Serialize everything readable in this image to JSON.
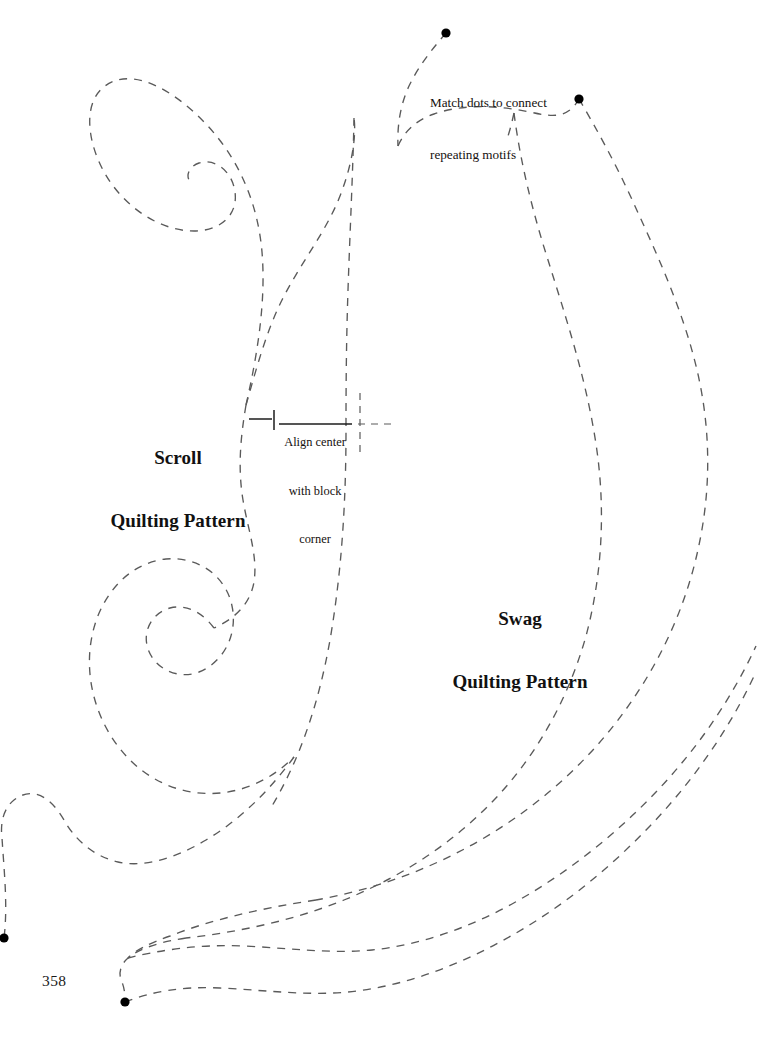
{
  "page": {
    "number": "358",
    "background_color": "#ffffff",
    "ink_color": "#5a5a5a",
    "dot_color": "#000000",
    "width": 760,
    "height": 1040
  },
  "labels": {
    "scroll_title": {
      "line1": "Scroll",
      "line2": "Quilting Pattern"
    },
    "swag_title": {
      "line1": "Swag",
      "line2": "Quilting Pattern"
    },
    "match_note": {
      "line1": "Match dots to connect",
      "line2": "repeating motifs"
    },
    "align_note": {
      "line1": "Align center",
      "line2": "with block",
      "line3": "corner"
    }
  },
  "chart_data": {
    "type": "line",
    "xlabel": "",
    "ylabel": "",
    "xlim": [
      0,
      760
    ],
    "ylim": [
      0,
      1040
    ],
    "grid": false,
    "legend": "none",
    "annotations": [
      {
        "name": "scroll-title",
        "text": "Scroll Quilting Pattern",
        "x": 178,
        "y": 420
      },
      {
        "name": "swag-title",
        "text": "Swag Quilting Pattern",
        "x": 520,
        "y": 583
      },
      {
        "name": "match-note",
        "text": "Match dots to connect repeating motifs",
        "x": 494,
        "y": 77
      },
      {
        "name": "align-note",
        "text": "Align center with block corner",
        "x": 315,
        "y": 424
      },
      {
        "name": "page-number",
        "text": "358",
        "x": 55,
        "y": 984
      }
    ],
    "registration_dots": [
      {
        "name": "top-match-dot",
        "x": 446,
        "y": 33,
        "r": 4.6
      },
      {
        "name": "upper-right-match-dot",
        "x": 579,
        "y": 99,
        "r": 4.6
      },
      {
        "name": "left-edge-match-dot",
        "x": 4,
        "y": 938,
        "r": 4.6
      },
      {
        "name": "bottom-match-dot",
        "x": 125,
        "y": 1002,
        "r": 4.6
      }
    ],
    "registration_marks": [
      {
        "name": "center-tick-dash-left",
        "type": "solid-segment",
        "x1": 249,
        "y1": 419,
        "x2": 272,
        "y2": 419
      },
      {
        "name": "center-tick-vertical",
        "type": "solid-segment",
        "x1": 274,
        "y1": 410,
        "x2": 274,
        "y2": 430
      },
      {
        "name": "align-note-rule",
        "type": "solid-segment",
        "x1": 279,
        "y1": 424,
        "x2": 352,
        "y2": 424
      },
      {
        "name": "center-vertical-dashed-axis",
        "type": "dashed-line",
        "x1": 360,
        "y1": 393,
        "x2": 360,
        "y2": 456
      },
      {
        "name": "center-horizontal-dashed-axis",
        "type": "dashed-line",
        "x1": 358,
        "y1": 424,
        "x2": 394,
        "y2": 424
      }
    ],
    "series": [
      {
        "name": "scroll-outer-spiral-upper",
        "stroke": "#5a5a5a",
        "dash": [
          8,
          7
        ],
        "path": "M 246 405 C 258 352 266 300 262 252 C 258 205 240 160 206 124 C 174 90 132 66 105 86 C 82 103 88 142 103 170 C 122 206 160 232 196 231 C 222 230 238 214 235 192 C 232 170 214 158 199 163 C 190 166 186 174 189 180"
      },
      {
        "name": "scroll-inner-curve-upper",
        "stroke": "#5a5a5a",
        "dash": [
          8,
          7
        ],
        "path": "M 246 405 C 256 370 266 332 282 300 C 300 264 326 232 340 196 C 354 160 356 132 354 118"
      },
      {
        "name": "scroll-stem-right",
        "stroke": "#5a5a5a",
        "dash": [
          8,
          7
        ],
        "path": "M 354 118 C 353 170 350 230 348 290 C 346 350 346 400 346 430 C 346 500 342 570 330 640 C 318 708 298 762 272 806"
      },
      {
        "name": "scroll-center-wave",
        "stroke": "#5a5a5a",
        "dash": [
          8,
          7
        ],
        "path": "M 246 405 C 240 440 238 470 243 500 C 248 530 258 556 254 582 C 250 606 232 620 214 628"
      },
      {
        "name": "scroll-outer-spiral-lower",
        "stroke": "#5a5a5a",
        "dash": [
          8,
          7
        ],
        "path": "M 214 628 C 202 612 186 604 170 608 C 152 613 142 631 148 649 C 155 669 178 680 199 672 C 224 662 238 634 232 606 C 226 576 198 556 166 559 C 128 563 100 596 92 636 C 83 680 98 728 130 760 C 162 792 208 802 250 786 C 268 779 282 769 294 757"
      },
      {
        "name": "swag-upper-left-tail",
        "stroke": "#5a5a5a",
        "dash": [
          8,
          7
        ],
        "path": "M 446 33 C 434 47 420 64 411 82 C 401 101 397 124 398 146"
      },
      {
        "name": "swag-inner-upper-arc",
        "stroke": "#5a5a5a",
        "dash": [
          8,
          7
        ],
        "path": "M 398 146 C 404 132 416 120 434 114 C 466 103 500 106 530 112 C 552 117 568 119 579 99"
      },
      {
        "name": "swag-inner-body",
        "stroke": "#5a5a5a",
        "dash": [
          8,
          7
        ],
        "path": "M 514 113 C 520 160 532 210 548 260 C 566 318 586 378 596 444 C 606 510 602 576 586 636 C 568 700 536 756 494 800 C 450 846 398 878 344 900 C 292 921 238 932 186 938"
      },
      {
        "name": "swag-outer-body",
        "stroke": "#5a5a5a",
        "dash": [
          8,
          7
        ],
        "path": "M 579 99 C 596 128 616 164 634 204 C 656 252 680 304 694 358 C 710 418 712 480 700 540 C 688 602 662 660 624 712 C 586 764 538 806 484 838 C 430 870 372 890 316 900"
      },
      {
        "name": "swag-lower-inner-sweep",
        "stroke": "#5a5a5a",
        "dash": [
          8,
          7
        ],
        "path": "M 186 938 C 160 942 140 948 128 958 C 120 965 118 974 122 982 C 125 990 125 996 125 1002"
      },
      {
        "name": "swag-lower-outer-sweep",
        "stroke": "#5a5a5a",
        "dash": [
          8,
          7
        ],
        "path": "M 316 900 C 262 908 210 920 170 936 C 148 944 134 951 128 958"
      },
      {
        "name": "swag-bottom-inner-return",
        "stroke": "#5a5a5a",
        "dash": [
          8,
          7
        ],
        "path": "M 125 1002 C 150 992 182 986 220 988 C 264 990 306 996 348 992 C 400 987 452 968 500 942 C 556 912 606 872 650 826 C 694 780 730 728 756 672"
      },
      {
        "name": "swag-bottom-outer-return",
        "stroke": "#5a5a5a",
        "dash": [
          8,
          7
        ],
        "path": "M 128 958 C 160 950 200 944 244 946 C 288 948 330 954 372 950 C 420 945 468 928 512 904 C 566 874 614 836 656 792 C 698 748 732 698 756 646"
      },
      {
        "name": "scroll-lower-tail-to-left-dot",
        "stroke": "#5a5a5a",
        "dash": [
          8,
          7
        ],
        "path": "M 294 757 C 270 790 240 820 206 840 C 176 858 144 868 118 862 C 92 856 74 838 64 820 C 50 796 32 786 14 800 C 4 808 0 822 2 838 C 4 870 8 906 4 938"
      },
      {
        "name": "swag-inner-top-stub",
        "stroke": "#5a5a5a",
        "dash": [
          8,
          7
        ],
        "path": "M 514 113 C 512 122 510 130 508 136"
      }
    ]
  }
}
